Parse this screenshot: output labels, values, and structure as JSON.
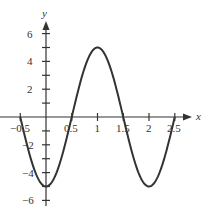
{
  "chart_data": {
    "type": "line",
    "title": "",
    "xlabel": "x",
    "ylabel": "y",
    "function": "y = -5cos(pi x)",
    "xlim": [
      -0.5,
      2.5
    ],
    "ylim": [
      -6,
      6
    ],
    "grid": false,
    "x_ticks": [
      -0.5,
      0.5,
      1,
      1.5,
      2,
      2.5
    ],
    "x_tick_labels": [
      "-0.5",
      "0.5",
      "1",
      "1.5",
      "2",
      "2.5"
    ],
    "y_ticks": [
      -6,
      -5,
      -4,
      -3,
      -2,
      -1,
      1,
      2,
      3,
      4,
      5,
      6
    ],
    "y_tick_labels": {
      "6": "6",
      "4": "4",
      "2": "2",
      "-2": "-2",
      "-4": "-4",
      "-6": "−6"
    },
    "series": [
      {
        "name": "curve",
        "x": [
          -0.5,
          -0.25,
          0,
          0.25,
          0.5,
          0.75,
          1,
          1.25,
          1.5,
          1.75,
          2,
          2.25,
          2.5
        ],
        "values": [
          0,
          -3.54,
          -5,
          -3.54,
          0,
          3.54,
          5,
          3.54,
          0,
          -3.54,
          -5,
          -3.54,
          0
        ],
        "color": "#333333"
      }
    ]
  },
  "labels": {
    "x_axis": "x",
    "y_axis": "y",
    "y6": "6",
    "y4": "4",
    "y2": "2",
    "yn2": "−2",
    "yn4": "−4",
    "yn6": "−6",
    "xn05": "−0.5",
    "x05": "0.5",
    "x1": "1",
    "x15": "1.5",
    "x2": "2",
    "x25": "2.5"
  }
}
